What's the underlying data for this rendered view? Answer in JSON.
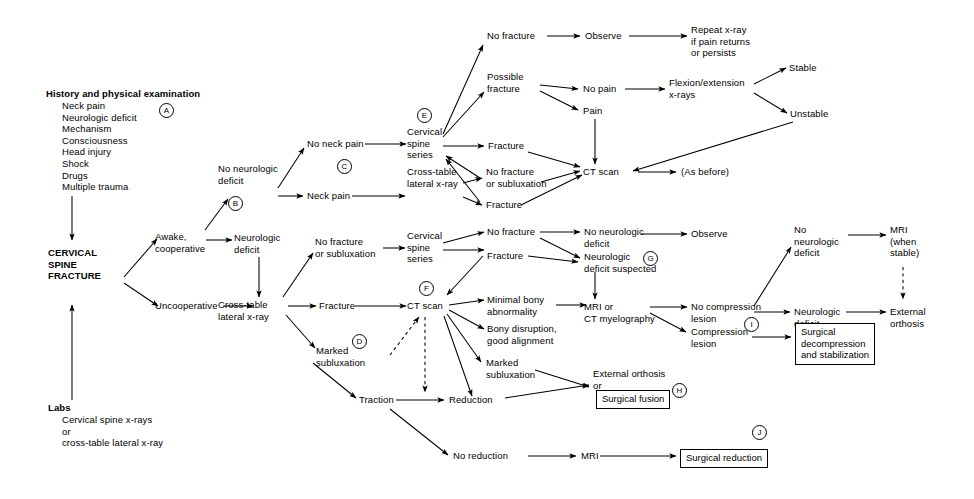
{
  "diagram": {
    "type": "clinical-decision-flowchart",
    "root": "CERVICAL SPINE FRACTURE",
    "line_color": "#000000",
    "background": "#ffffff"
  },
  "nodes": {
    "history_heading": "History and physical examination",
    "history_items": "Neck pain\nNeurologic deficit\nMechanism\nConsciousness\nHead injury\nShock\nDrugs\nMultiple trauma",
    "root": "CERVICAL\nSPINE\nFRACTURE",
    "labs_heading": "Labs",
    "labs_items": "Cervical spine x-rays\n   or\ncross-table lateral x-ray",
    "awake": "Awake,\ncooperative",
    "uncooperative": "Uncooperative",
    "no_neuro_deficit": "No neurologic\ndeficit",
    "neuro_deficit": "Neurologic\ndeficit",
    "no_neck_pain": "No neck pain",
    "neck_pain": "Neck pain",
    "cross_table_1": "Cross-table\nlateral x-ray",
    "cspine_series_1": "Cervical\nspine\nseries",
    "cross_table_lateral_xray_2": "Cross-table\nlateral x-ray",
    "no_fracture_top": "No fracture",
    "possible_fracture": "Possible\nfracture",
    "fracture_e1": "Fracture",
    "no_fracture_or_sublux_e": "No fracture\nor subluxation",
    "fracture_e2": "Fracture",
    "observe_top": "Observe",
    "repeat_xray": "Repeat x-ray\nif pain returns\nor persists",
    "no_pain": "No pain",
    "pain": "Pain",
    "flexion_extension": "Flexion/extension\nx-rays",
    "stable": "Stable",
    "unstable": "Unstable",
    "ct_scan_top": "CT scan",
    "as_before": "(As before)",
    "no_fracture_or_sublux_f": "No fracture\nor subluxation",
    "fracture_f": "Fracture",
    "marked_sublux_f": "Marked\nsubluxation",
    "cross_table_lateral_xray_3": "Cross-table\nlateral x-ray",
    "cspine_series_2": "Cervical\nspine\nseries",
    "ct_scan_mid": "CT scan",
    "traction": "Traction",
    "no_fracture_g": "No fracture",
    "fracture_g": "Fracture",
    "minimal_bony": "Minimal bony\nabnormality",
    "bony_disruption": "Bony disruption,\ngood alignment",
    "marked_sublux_2": "Marked\nsubluxation",
    "reduction": "Reduction",
    "no_reduction": "No reduction",
    "no_neuro_deficit_g": "No neurologic\ndeficit",
    "neuro_deficit_suspected": "Neurologic\ndeficit suspected",
    "observe_mid": "Observe",
    "mri_or_ct_myelography": "MRI or\nCT myelography",
    "external_orthosis_or": "External orthosis\nor",
    "surgical_fusion": "Surgical fusion",
    "mri_bottom": "MRI",
    "surgical_reduction": "Surgical reduction",
    "no_compression_lesion": "No compression\nlesion",
    "compression_lesion": "Compression\nlesion",
    "no_neuro_deficit_right": "No\nneurologic\ndeficit",
    "neuro_deficit_right": "Neurologic\ndeficit",
    "mri_when_stable": "MRI\n(when\nstable)",
    "external_orthosis_right": "External\northosis",
    "surgical_decompression": "Surgical\ndecompression\nand stabilization"
  },
  "keys": {
    "a": "A",
    "b": "B",
    "c": "C",
    "d": "D",
    "e": "E",
    "f": "F",
    "g": "G",
    "h": "H",
    "i": "I",
    "j": "J"
  }
}
